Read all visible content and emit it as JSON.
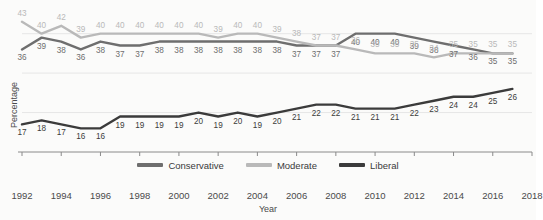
{
  "title": "",
  "axis": {
    "ylabel": "Percentage",
    "xlabel": "Year",
    "xticks": [
      1992,
      1994,
      1996,
      1998,
      2000,
      2002,
      2004,
      2006,
      2008,
      2010,
      2012,
      2014,
      2016,
      2018
    ],
    "xlim": [
      1992,
      2018
    ],
    "ylim": [
      10,
      46
    ]
  },
  "legend": {
    "items": [
      {
        "label": "Conservative",
        "color": "#6e6e6e"
      },
      {
        "label": "Moderate",
        "color": "#b9b9b9"
      },
      {
        "label": "Liberal",
        "color": "#3b3b3b"
      }
    ]
  },
  "colors": {
    "conservative": "#6e6e6e",
    "moderate": "#b9b9b9",
    "liberal": "#3b3b3b",
    "grid": "#e6e6e6",
    "axis": "#8a8a8a",
    "text": "#4a4a4a",
    "background": "#fbfbfa"
  },
  "chart_data": {
    "type": "line",
    "title": "",
    "xlabel": "Year",
    "ylabel": "Percentage",
    "xlim": [
      1992,
      2018
    ],
    "ylim": [
      10,
      46
    ],
    "grid": true,
    "legend_position": "bottom",
    "x": [
      1992,
      1993,
      1994,
      1995,
      1996,
      1997,
      1998,
      1999,
      2000,
      2001,
      2002,
      2003,
      2004,
      2005,
      2006,
      2007,
      2008,
      2009,
      2010,
      2011,
      2012,
      2013,
      2014,
      2015,
      2016,
      2017
    ],
    "series": [
      {
        "name": "Conservative",
        "color": "#6e6e6e",
        "values": [
          36,
          39,
          38,
          36,
          38,
          37,
          37,
          38,
          38,
          38,
          38,
          38,
          38,
          38,
          37,
          37,
          37,
          40,
          40,
          40,
          39,
          38,
          37,
          36,
          35,
          35
        ]
      },
      {
        "name": "Moderate",
        "color": "#b9b9b9",
        "values": [
          43,
          40,
          42,
          39,
          40,
          40,
          40,
          40,
          40,
          40,
          39,
          40,
          40,
          39,
          38,
          37,
          37,
          36,
          35,
          35,
          35,
          34,
          35,
          35,
          35,
          35
        ]
      },
      {
        "name": "Liberal",
        "color": "#3b3b3b",
        "values": [
          17,
          18,
          17,
          16,
          16,
          19,
          19,
          19,
          19,
          20,
          19,
          20,
          19,
          20,
          21,
          22,
          22,
          21,
          21,
          21,
          22,
          23,
          24,
          24,
          25,
          26
        ]
      }
    ]
  }
}
